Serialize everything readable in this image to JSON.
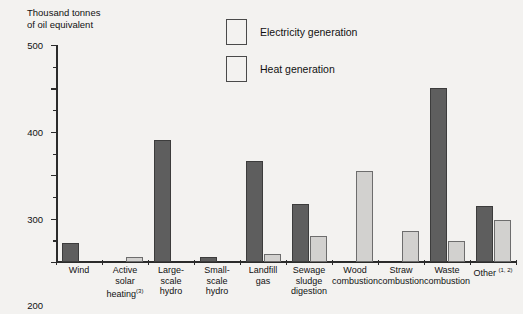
{
  "axis_title": "Thousand tonnes\nof oil equivalent",
  "legend": {
    "position": "top-center",
    "items": [
      {
        "label": "Electricity generation",
        "color": "#5e5e5e",
        "key": "electricity"
      },
      {
        "label": "Heat generation",
        "color": "#d2d1cf",
        "key": "heat"
      }
    ]
  },
  "yaxis": {
    "ticks": [
      "0",
      "100",
      "200",
      "300",
      "400",
      "500"
    ],
    "min": 0,
    "max": 500,
    "minor_step": 50
  },
  "chart_data": {
    "type": "bar",
    "title": "",
    "subtitle": "",
    "xlabel": "",
    "ylabel": "Thousand tonnes of oil equivalent",
    "ylim": [
      0,
      500
    ],
    "grid": false,
    "legend_position": "top-center",
    "categories": [
      "Wind",
      "Active solar heating(3)",
      "Large-scale hydro",
      "Small-scale hydro",
      "Landfill gas",
      "Sewage sludge digestion",
      "Wood combustion",
      "Straw combustion",
      "Waste combustion",
      "Other (1, 2)"
    ],
    "category_lines": [
      [
        "Wind"
      ],
      [
        "Active",
        "solar",
        "heating(3)"
      ],
      [
        "Large-",
        "scale",
        "hydro"
      ],
      [
        "Small-",
        "scale",
        "hydro"
      ],
      [
        "Landfill",
        "gas"
      ],
      [
        "Sewage",
        "sludge",
        "digestion"
      ],
      [
        "Wood",
        "combustion"
      ],
      [
        "Straw",
        "combustion"
      ],
      [
        "Waste",
        "combustion"
      ],
      [
        "Other (1, 2)"
      ]
    ],
    "series": [
      {
        "name": "Electricity generation",
        "color": "#5e5e5e",
        "values": [
          43,
          0,
          281,
          12,
          233,
          133,
          0,
          0,
          401,
          130
        ]
      },
      {
        "name": "Heat generation",
        "color": "#d2d1cf",
        "values": [
          0,
          11,
          0,
          0,
          18,
          60,
          210,
          72,
          48,
          97
        ]
      }
    ],
    "footnote_markers": [
      "(1)",
      "(2)",
      "(3)"
    ]
  }
}
